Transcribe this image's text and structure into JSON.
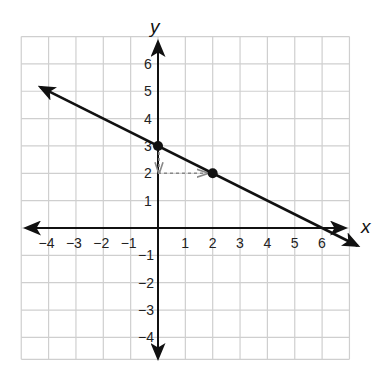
{
  "chart_data": {
    "type": "line",
    "title": "",
    "xlabel": "x",
    "ylabel": "y",
    "xlim": [
      -5,
      7
    ],
    "ylim": [
      -4.8,
      7
    ],
    "grid": true,
    "x_ticks": [
      -4,
      -3,
      -2,
      -1,
      1,
      2,
      3,
      4,
      5,
      6
    ],
    "y_ticks": [
      6,
      5,
      4,
      3,
      2,
      1,
      -1,
      -2,
      -3,
      -4
    ],
    "x_tick_labels": [
      "−4",
      "−3",
      "−2",
      "−1",
      "1",
      "2",
      "3",
      "4",
      "5",
      "6"
    ],
    "y_tick_labels": [
      "6",
      "5",
      "4",
      "3",
      "2",
      "1",
      "−1",
      "−2",
      "−3",
      "−4"
    ],
    "series": [
      {
        "name": "line",
        "equation": "y = -1/2 x + 3",
        "slope": -0.5,
        "intercept": 3,
        "x": [
          -4.3,
          7.3
        ],
        "y": [
          5.15,
          -0.65
        ],
        "arrows": "both ends"
      }
    ],
    "points": [
      {
        "x": 0,
        "y": 3,
        "label": "y-intercept"
      },
      {
        "x": 2,
        "y": 2
      }
    ],
    "annotations": [
      {
        "type": "dashed-arrow",
        "from": [
          0,
          3
        ],
        "to": [
          0,
          2
        ],
        "meaning": "rise = -1"
      },
      {
        "type": "dashed-arrow",
        "from": [
          0,
          2
        ],
        "to": [
          2,
          2
        ],
        "meaning": "run = 2"
      }
    ]
  },
  "labels": {
    "x_axis": "x",
    "y_axis": "y"
  }
}
